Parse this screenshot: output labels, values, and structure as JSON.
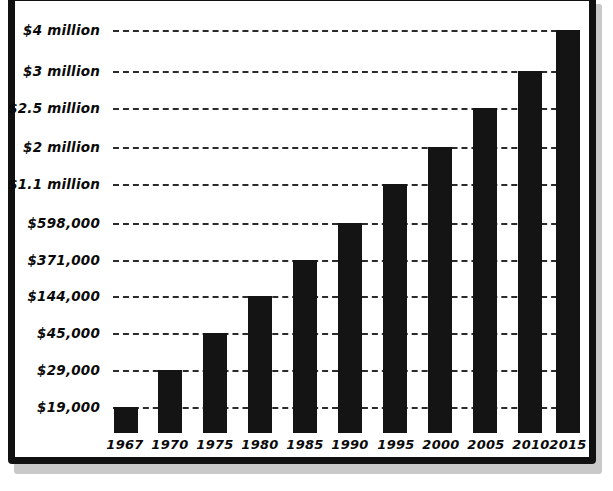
{
  "chart_data": {
    "type": "bar",
    "title": "",
    "subtitle": "",
    "xlabel": "",
    "ylabel": "",
    "grid": true,
    "legend": null,
    "axis_scale": "categorical-stepped",
    "categories": [
      "1967",
      "1970",
      "1975",
      "1980",
      "1985",
      "1990",
      "1995",
      "2000",
      "2005",
      "2010",
      "2015"
    ],
    "value_labels": [
      "$19,000",
      "$29,000",
      "$45,000",
      "$144,000",
      "$371,000",
      "$598,000",
      "$1.1 million",
      "$2 million",
      "$2.5 million",
      "$3 million",
      "$4 million"
    ],
    "values": [
      19000,
      29000,
      45000,
      144000,
      371000,
      598000,
      1100000,
      2000000,
      2500000,
      3000000,
      4000000
    ],
    "ytick_labels": [
      "$19,000",
      "$29,000",
      "$45,000",
      "$144,000",
      "$371,000",
      "$598,000",
      "$1.1 million",
      "$2 million",
      "$2.5 million",
      "$3 million",
      "$4 million"
    ],
    "ytick_values": [
      19000,
      29000,
      45000,
      144000,
      371000,
      598000,
      1100000,
      2000000,
      2500000,
      3000000,
      4000000
    ],
    "ylim": [
      0,
      4000000
    ],
    "bar_color": "#141414",
    "gridline_color": "#2b2b2b",
    "background_color": "#ffffff",
    "frame_color": "#111111"
  },
  "axis": {
    "y_ticks": [
      {
        "label": "$4 million",
        "y": 30
      },
      {
        "label": "$3 million",
        "y": 71
      },
      {
        "label": "$2.5 million",
        "y": 108
      },
      {
        "label": "$2 million",
        "y": 147
      },
      {
        "label": "$1.1 million",
        "y": 184
      },
      {
        "label": "$598,000",
        "y": 223
      },
      {
        "label": "$371,000",
        "y": 260
      },
      {
        "label": "$144,000",
        "y": 296
      },
      {
        "label": "$45,000",
        "y": 333
      },
      {
        "label": "$29,000",
        "y": 370
      },
      {
        "label": "$19,000",
        "y": 407
      }
    ],
    "x_ticks": [
      {
        "label": "1967",
        "x": 12
      },
      {
        "label": "1970",
        "x": 57
      },
      {
        "label": "1975",
        "x": 102
      },
      {
        "label": "1980",
        "x": 147
      },
      {
        "label": "1985",
        "x": 192
      },
      {
        "label": "1990",
        "x": 237
      },
      {
        "label": "1995",
        "x": 283
      },
      {
        "label": "2000",
        "x": 328
      },
      {
        "label": "2005",
        "x": 373
      },
      {
        "label": "2010",
        "x": 418
      },
      {
        "label": "2015",
        "x": 455
      }
    ]
  },
  "bars": [
    {
      "label": "1967",
      "value_label": "$19,000",
      "left": 1,
      "width": 24,
      "top": 407
    },
    {
      "label": "1970",
      "value_label": "$29,000",
      "left": 45,
      "width": 24,
      "top": 370
    },
    {
      "label": "1975",
      "value_label": "$45,000",
      "left": 90,
      "width": 24,
      "top": 333
    },
    {
      "label": "1980",
      "value_label": "$144,000",
      "left": 135,
      "width": 24,
      "top": 296
    },
    {
      "label": "1985",
      "value_label": "$371,000",
      "left": 180,
      "width": 24,
      "top": 260
    },
    {
      "label": "1990",
      "value_label": "$598,000",
      "left": 225,
      "width": 24,
      "top": 223
    },
    {
      "label": "1995",
      "value_label": "$1.1 million",
      "left": 270,
      "width": 24,
      "top": 184
    },
    {
      "label": "2000",
      "value_label": "$2 million",
      "left": 315,
      "width": 24,
      "top": 147
    },
    {
      "label": "2005",
      "value_label": "$2.5 million",
      "left": 360,
      "width": 24,
      "top": 108
    },
    {
      "label": "2010",
      "value_label": "$3 million",
      "left": 405,
      "width": 24,
      "top": 71
    },
    {
      "label": "2015",
      "value_label": "$4 million",
      "left": 443,
      "width": 24,
      "top": 30
    }
  ]
}
